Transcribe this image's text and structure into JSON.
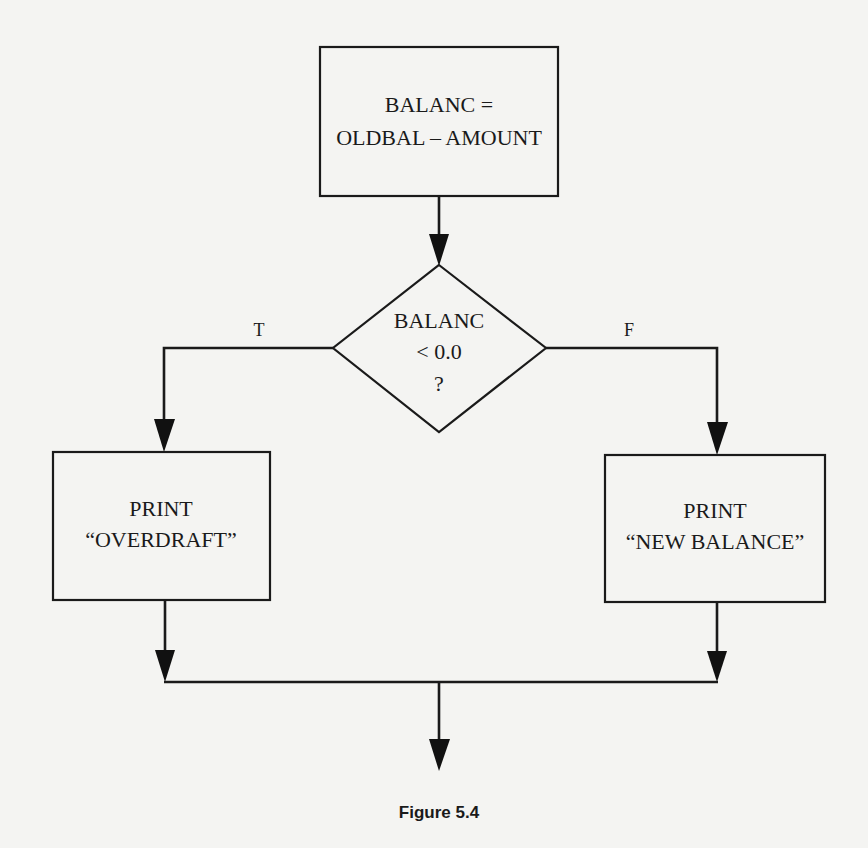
{
  "diagram": {
    "type": "flowchart",
    "nodes": {
      "process": {
        "shape": "rectangle",
        "lines": [
          "BALANC =",
          "OLDBAL – AMOUNT"
        ]
      },
      "decision": {
        "shape": "diamond",
        "lines": [
          "BALANC",
          "< 0.0",
          "?"
        ]
      },
      "print_overdraft": {
        "shape": "rectangle",
        "lines": [
          "PRINT",
          "“OVERDRAFT”"
        ]
      },
      "print_new_balance": {
        "shape": "rectangle",
        "lines": [
          "PRINT",
          "“NEW BALANCE”"
        ]
      }
    },
    "edges": [
      {
        "from": "process",
        "to": "decision",
        "label": ""
      },
      {
        "from": "decision",
        "to": "print_overdraft",
        "label": "T"
      },
      {
        "from": "decision",
        "to": "print_new_balance",
        "label": "F"
      },
      {
        "from": "print_overdraft",
        "to": "merge",
        "label": ""
      },
      {
        "from": "print_new_balance",
        "to": "merge",
        "label": ""
      },
      {
        "from": "merge",
        "to": "exit",
        "label": ""
      }
    ],
    "branch_labels": {
      "true": "T",
      "false": "F"
    },
    "caption": "Figure 5.4"
  },
  "colors": {
    "background": "#f4f4f2",
    "ink": "#1a1a1a"
  }
}
